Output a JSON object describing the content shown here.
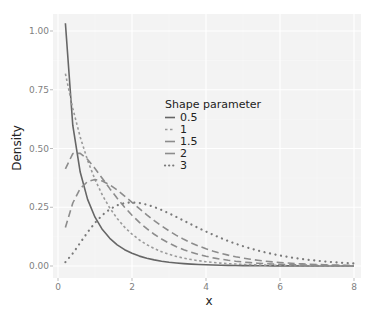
{
  "chart_data": {
    "type": "line",
    "title": "",
    "xlabel": "x",
    "ylabel": "Density",
    "xlim": [
      0,
      8
    ],
    "ylim": [
      0,
      1.05
    ],
    "x_ticks": [
      0,
      2,
      4,
      6,
      8
    ],
    "x_tick_labels": [
      "0",
      "2",
      "4",
      "6",
      "8"
    ],
    "y_ticks": [
      0,
      0.25,
      0.5,
      0.75,
      1.0
    ],
    "y_tick_labels": [
      "0.00",
      "0.25",
      "0.50",
      "0.75",
      "1.00"
    ],
    "grid": true,
    "legend": {
      "title": "Shape parameter",
      "placement": "center",
      "entries": [
        "0.5",
        "1",
        "1.5",
        "2",
        "3"
      ]
    },
    "x": [
      0.2,
      0.4,
      0.6,
      0.8,
      1.0,
      1.2,
      1.4,
      1.6,
      1.8,
      2.0,
      2.2,
      2.4,
      2.6,
      2.8,
      3.0,
      3.2,
      3.4,
      3.6,
      3.8,
      4.0,
      4.2,
      4.4,
      4.6,
      4.8,
      5.0,
      5.2,
      5.4,
      5.6,
      5.8,
      6.0,
      6.2,
      6.4,
      6.6,
      6.8,
      7.0,
      7.2,
      7.4,
      7.6,
      7.8,
      8.0
    ],
    "series": [
      {
        "name": "0.5",
        "linetype": "solid",
        "color": "#666666",
        "values": [
          1.0329,
          0.598,
          0.3997,
          0.2834,
          0.2076,
          0.1551,
          0.1176,
          0.0901,
          0.0695,
          0.054,
          0.0421,
          0.033,
          0.026,
          0.0205,
          0.0162,
          0.0129,
          0.0102,
          0.0081,
          0.0065,
          0.0052,
          0.0041,
          0.0033,
          0.0026,
          0.0021,
          0.0017,
          0.0014,
          0.0011,
          0.0009,
          0.0007,
          0.0006,
          0.0005,
          0.0004,
          0.0003,
          0.0002,
          0.0002,
          0.0002,
          0.0001,
          0.0001,
          0.0001,
          0.0001
        ]
      },
      {
        "name": "1",
        "linetype": "dashed-short",
        "color": "#9a9a9a",
        "values": [
          0.8187,
          0.6703,
          0.5488,
          0.4493,
          0.3679,
          0.3012,
          0.2466,
          0.2019,
          0.1653,
          0.1353,
          0.1108,
          0.0907,
          0.0743,
          0.0608,
          0.0498,
          0.0408,
          0.0334,
          0.0273,
          0.0224,
          0.0183,
          0.015,
          0.0123,
          0.0101,
          0.0082,
          0.0067,
          0.0055,
          0.0045,
          0.0037,
          0.003,
          0.0025,
          0.002,
          0.0017,
          0.0014,
          0.0011,
          0.0009,
          0.0007,
          0.0006,
          0.0005,
          0.0004,
          0.0003
        ]
      },
      {
        "name": "1.5",
        "linetype": "dashed-long",
        "color": "#8c8c8c",
        "values": [
          0.4132,
          0.4784,
          0.4797,
          0.4535,
          0.4151,
          0.3723,
          0.3292,
          0.2882,
          0.2502,
          0.216,
          0.1854,
          0.1586,
          0.1351,
          0.1148,
          0.0973,
          0.0823,
          0.0694,
          0.0585,
          0.0492,
          0.0413,
          0.0347,
          0.0291,
          0.0243,
          0.0203,
          0.017,
          0.0142,
          0.0119,
          0.0099,
          0.0082,
          0.0069,
          0.0057,
          0.0048,
          0.004,
          0.0033,
          0.0027,
          0.0023,
          0.0019,
          0.0016,
          0.0013,
          0.0011
        ]
      },
      {
        "name": "2",
        "linetype": "dashed-long",
        "color": "#8c8c8c",
        "values": [
          0.1637,
          0.2681,
          0.3293,
          0.3595,
          0.3679,
          0.3614,
          0.3452,
          0.323,
          0.2975,
          0.2707,
          0.2438,
          0.2177,
          0.1931,
          0.1703,
          0.1494,
          0.1304,
          0.1135,
          0.0984,
          0.085,
          0.0733,
          0.063,
          0.054,
          0.0462,
          0.0395,
          0.0337,
          0.0287,
          0.0244,
          0.0207,
          0.0176,
          0.0149,
          0.0126,
          0.0106,
          0.009,
          0.0076,
          0.0064,
          0.0054,
          0.0045,
          0.0038,
          0.0032,
          0.0027
        ]
      },
      {
        "name": "3",
        "linetype": "dotted",
        "color": "#7a7a7a",
        "values": [
          0.0164,
          0.0536,
          0.0988,
          0.1438,
          0.1839,
          0.2169,
          0.2417,
          0.2584,
          0.2678,
          0.2707,
          0.2681,
          0.2613,
          0.251,
          0.2384,
          0.224,
          0.2087,
          0.1929,
          0.177,
          0.1615,
          0.1465,
          0.1323,
          0.1189,
          0.1063,
          0.0948,
          0.0842,
          0.0746,
          0.0659,
          0.058,
          0.051,
          0.0446,
          0.039,
          0.034,
          0.0296,
          0.0257,
          0.0223,
          0.0194,
          0.0167,
          0.0144,
          0.0125,
          0.0107
        ]
      }
    ]
  },
  "colors": {
    "panel_background": "#f3f3f3",
    "grid_major": "#ffffff",
    "grid_minor": "#f9f9f9",
    "tick_text": "#7f7f7f",
    "title_text": "#222222"
  }
}
